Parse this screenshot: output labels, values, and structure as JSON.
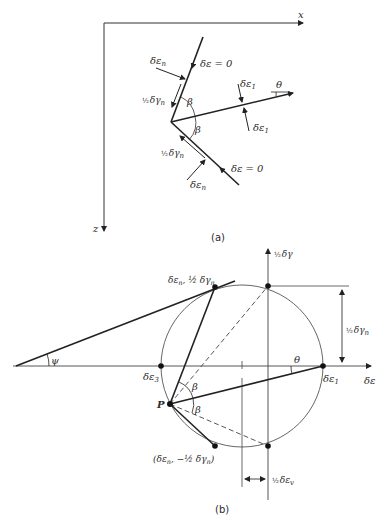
{
  "figure_a": {
    "caption": "(a)",
    "axes": {
      "x_label": "x",
      "z_label": "z"
    },
    "labels": {
      "de_n_top": "δε",
      "de_n_top_sub": "n",
      "de_zero_top": "δε = 0",
      "half_dg_top_frac": "½",
      "half_dg_top": "δγ",
      "half_dg_top_sub": "n",
      "beta_top": "β",
      "beta_bottom": "β",
      "de1_top": "δε",
      "de1_top_sub": "1",
      "de1_bottom": "δε",
      "de1_bottom_sub": "1",
      "theta": "θ",
      "half_dg_bottom_frac": "½",
      "half_dg_bottom": "δγ",
      "half_dg_bottom_sub": "n",
      "de_zero_bottom": "δε = 0",
      "de_n_bottom": "δε",
      "de_n_bottom_sub": "n"
    }
  },
  "figure_b": {
    "caption": "(b)",
    "axes": {
      "horizontal_label": "δε",
      "vertical_label_frac": "½",
      "vertical_label": "δγ"
    },
    "labels": {
      "top_point": "δε",
      "top_point_sub": "n",
      "top_point_rest": ", ½ δγ",
      "top_point_rest_sub": "n",
      "bottom_point": "(δε",
      "bottom_point_sub": "n",
      "bottom_point_rest": ", −½ δγ",
      "bottom_point_rest_sub": "n",
      "bottom_point_close": ")",
      "de3": "δε",
      "de3_sub": "3",
      "de1": "δε",
      "de1_sub": "1",
      "pole": "P",
      "psi": "ψ",
      "theta": "θ",
      "beta_top": "β",
      "beta_bottom": "β",
      "dim_right_frac": "½",
      "dim_right": "δγ",
      "dim_right_sub": "n",
      "dim_bottom_frac": "½",
      "dim_bottom": "δε",
      "dim_bottom_sub": "v"
    },
    "circle": {
      "center_x": 242,
      "center_y": 366,
      "radius": 81
    }
  }
}
